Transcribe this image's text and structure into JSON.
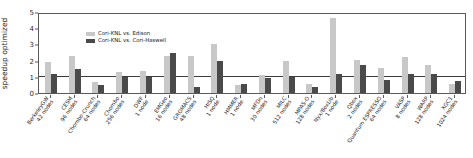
{
  "chart_data": {
    "type": "bar",
    "title": "",
    "xlabel": "",
    "ylabel": "speedup optimized",
    "ylim": [
      0,
      5
    ],
    "yticks": [
      0,
      1,
      2,
      3,
      4,
      5
    ],
    "grid": false,
    "legend_position": "upper-left-inside",
    "reference_line": {
      "value": 1,
      "color": "#3c3c3c"
    },
    "categories": [
      "BerkeleyGW\n42 nodes",
      "CESM\n96 nodes",
      "Chombo-Crunch\n64 nodes",
      "Chombo\n256 nodes",
      "DWF\n1 node",
      "EMGeo\n16 nodes",
      "GROMACS\n48 nodes",
      "HISQ\n1 node",
      "HMMER\n1 node",
      "MFDn\n30 nodes",
      "MILC\n512 nodes",
      "MPAS-O\n128 nodes",
      "Nyx/BoxLib\n1 node",
      "Qbox\n2 nodes",
      "Quantum ESPRESSO\n64 nodes",
      "VASP\n8 nodes",
      "WARP\n128 nodes",
      "XGC1\n1024 nodes"
    ],
    "category_names": [
      "BerkeleyGW",
      "CESM",
      "Chombo-Crunch",
      "Chombo",
      "DWF",
      "EMGeo",
      "GROMACS",
      "HISQ",
      "HMMER",
      "MFDn",
      "MILC",
      "MPAS-O",
      "Nyx/BoxLib",
      "Qbox",
      "Quantum ESPRESSO",
      "VASP",
      "WARP",
      "XGC1"
    ],
    "category_nodes": [
      "42 nodes",
      "96 nodes",
      "64 nodes",
      "256 nodes",
      "1 node",
      "16 nodes",
      "48 nodes",
      "1 node",
      "1 node",
      "30 nodes",
      "512 nodes",
      "128 nodes",
      "1 node",
      "2 nodes",
      "64 nodes",
      "8 nodes",
      "128 nodes",
      "1024 nodes"
    ],
    "series": [
      {
        "name": "Cori-KNL vs. Edison",
        "color": "#c8c8c8",
        "values": [
          1.9,
          2.3,
          0.65,
          1.3,
          1.35,
          2.3,
          2.3,
          3.0,
          0.5,
          1.1,
          2.0,
          0.55,
          4.6,
          2.05,
          1.55,
          2.2,
          1.75,
          0.55
        ]
      },
      {
        "name": "Cori-KNL vs. Cori-Haswell",
        "color": "#4a4a4a",
        "values": [
          1.2,
          1.5,
          0.5,
          1.0,
          1.0,
          2.5,
          0.4,
          2.0,
          0.55,
          0.9,
          1.0,
          0.35,
          1.2,
          1.75,
          0.8,
          1.2,
          1.15,
          0.75
        ]
      }
    ]
  },
  "legend": {
    "items": [
      {
        "label": "Cori-KNL vs. Edison",
        "color": "#c8c8c8"
      },
      {
        "label": "Cori-KNL vs. Cori-Haswell",
        "color": "#4a4a4a"
      }
    ]
  }
}
